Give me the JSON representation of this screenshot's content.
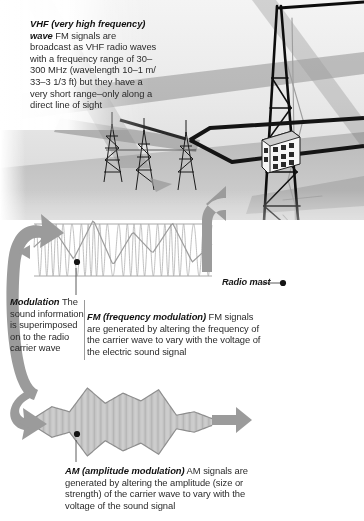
{
  "figure": {
    "background_color": "#ffffff",
    "accent_gray": "#8c8c8c",
    "ink_color": "#2b2b2b"
  },
  "callouts": {
    "vhf": {
      "lead": "VHF (very high frequency) wave",
      "body": " FM signals are broadcast as VHF radio waves with a frequency range of 30–300 MHz (wavelength 10–1 m/ 33–3 1/3 ft) but they have a very short range–only along a direct line of sight"
    },
    "modulation": {
      "lead": "Modulation",
      "body": " The sound information is superimposed on to the radio carrier wave"
    },
    "fm": {
      "lead": "FM (frequency modulation)",
      "body": " FM signals are generated by altering the frequency of the carrier wave to vary with the voltage of the electric sound signal"
    },
    "am": {
      "lead": "AM (amplitude modulation)",
      "body": " AM signals are generated by altering the amplitude (size or strength) of the carrier wave to vary with the voltage of the sound signal"
    },
    "radio_mast": {
      "label": "Radio mast"
    }
  },
  "icons": {
    "radio_mast": "radio-mast-icon",
    "small_mast": "small-radio-mast-icon",
    "building": "building-icon",
    "fm_wave": "fm-waveform-icon",
    "am_wave": "am-waveform-icon",
    "curved_arrow": "curved-arrow-icon",
    "straight_arrow": "straight-arrow-icon",
    "leader_line": "leader-line-icon",
    "callout_dot": "callout-dot-icon"
  },
  "chart_data": {
    "type": "line",
    "xlabel": "",
    "ylabel": "",
    "grid": false,
    "legend": "none",
    "series": [
      {
        "name": "FM (frequency modulation) carrier",
        "description": "Constant amplitude, frequency varies with the modulating signal",
        "carrier_amplitude": 1.0,
        "carrier_frequency_min_hz": 6,
        "carrier_frequency_max_hz": 34,
        "modulating_envelope": [
          0.55,
          0.85,
          0.35,
          1.0,
          0.25,
          0.8,
          0.45,
          0.95,
          0.3,
          0.6
        ]
      },
      {
        "name": "AM (amplitude modulation) carrier",
        "description": "Constant frequency, amplitude varies with the modulating signal",
        "carrier_frequency_hz": 30,
        "envelope": [
          0.12,
          0.45,
          0.3,
          1.0,
          0.55,
          0.85,
          0.62,
          0.95,
          0.2,
          0.3,
          0.1
        ]
      }
    ]
  }
}
